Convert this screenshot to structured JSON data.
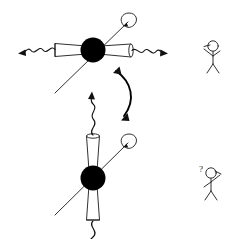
{
  "figure": {
    "background_color": "#ffffff",
    "ink_color": "#111111",
    "nucleus_color": "#000000",
    "width": 233,
    "height": 239
  },
  "panels": [
    {
      "id": "top-configuration",
      "name": "transverse-emission-configuration",
      "nucleus": {
        "cx": 93,
        "cy": 50,
        "r": 12.5
      },
      "emission_axis": "horizontal",
      "cones": [
        {
          "side": "left",
          "label": "emission-cone-left"
        },
        {
          "side": "right",
          "label": "emission-cone-right"
        }
      ],
      "photons": [
        {
          "side": "left",
          "direction": "outward-left",
          "label": "photon-wave-left"
        },
        {
          "side": "right",
          "direction": "outward-right",
          "label": "photon-wave-right"
        }
      ],
      "spin_axis": {
        "label": "spin-axis-arrow",
        "orientation": "diagonal-up-right",
        "spin_marker": "counter-clockwise-loop"
      }
    },
    {
      "id": "bottom-configuration",
      "name": "longitudinal-emission-configuration",
      "nucleus": {
        "cx": 93,
        "cy": 178,
        "r": 12.5
      },
      "emission_axis": "vertical",
      "cones": [
        {
          "side": "up",
          "label": "emission-cone-up"
        },
        {
          "side": "down",
          "label": "emission-cone-down"
        }
      ],
      "photons": [
        {
          "side": "up",
          "direction": "outward-up",
          "label": "photon-wave-up"
        },
        {
          "side": "down",
          "direction": "outward-down",
          "label": "photon-wave-down"
        }
      ],
      "spin_axis": {
        "label": "spin-axis-arrow",
        "orientation": "diagonal-up-right",
        "spin_marker": "counter-clockwise-loop"
      }
    }
  ],
  "connector": {
    "name": "bidirectional-transition-arrow",
    "type": "curved-double-headed",
    "from": "top-configuration",
    "to": "bottom-configuration"
  },
  "observers": [
    {
      "id": "observer-top",
      "name": "stick-figure-observer-top",
      "pose": "arm-pointing-left",
      "annotation": "",
      "x": 212,
      "y": 55
    },
    {
      "id": "observer-bottom",
      "name": "stick-figure-observer-bottom",
      "pose": "arm-pointing-right",
      "annotation": "?",
      "x": 212,
      "y": 182
    }
  ]
}
